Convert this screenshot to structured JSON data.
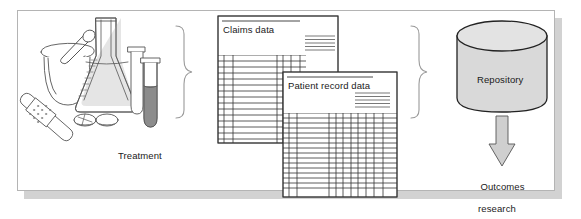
{
  "figure": {
    "type": "process-flow-diagram",
    "background_color": "#ffffff",
    "frame_border_color": "#b4b4b4",
    "shadow_color": "#d2d2d2"
  },
  "labels": {
    "treatment": "Treatment",
    "claims_data": "Claims data",
    "patient_record_data": "Patient record data",
    "repository": "Repository",
    "outcomes_line1": "Outcomes",
    "outcomes_line2": "research"
  },
  "stages": [
    {
      "id": "treatment",
      "label": "Treatment",
      "kind": "illustration",
      "icons": [
        "mortar-and-pestle-icon",
        "erlenmeyer-flask-icon",
        "test-tube-icon",
        "syringe-tube-icon",
        "pill-icon",
        "bandage-icon"
      ]
    },
    {
      "id": "data-sources",
      "label": "Claims data / Patient record data",
      "kind": "documents",
      "documents": [
        "Claims data",
        "Patient record data"
      ]
    },
    {
      "id": "repository",
      "label": "Repository",
      "kind": "cylinder"
    },
    {
      "id": "outcomes",
      "label": "Outcomes research",
      "kind": "terminal"
    }
  ],
  "connectors": [
    {
      "id": "brace-1",
      "kind": "curly-brace",
      "direction": "right",
      "from": "treatment",
      "to": "data-sources"
    },
    {
      "id": "brace-2",
      "kind": "curly-brace",
      "direction": "right",
      "from": "data-sources",
      "to": "repository"
    },
    {
      "id": "arrow-1",
      "kind": "block-arrow",
      "direction": "down",
      "from": "repository",
      "to": "outcomes"
    }
  ],
  "colors": {
    "stroke": "#333333",
    "light_stroke": "#7a7a7a",
    "cylinder_fill": "#d9d9d9",
    "cylinder_top_fill": "#e3e3e3",
    "arrow_fill": "#cfcfcf",
    "liquid_fill": "#8c8c8c",
    "flask_liquid_fill": "#c9c9c9",
    "paper_fill": "#ffffff",
    "text": "#1a1a1a"
  },
  "tables": {
    "claims": {
      "rows": 14,
      "columns": 5,
      "header_rule": true
    },
    "patient_record": {
      "rows": 16,
      "columns": 9,
      "header_rule": true
    }
  }
}
